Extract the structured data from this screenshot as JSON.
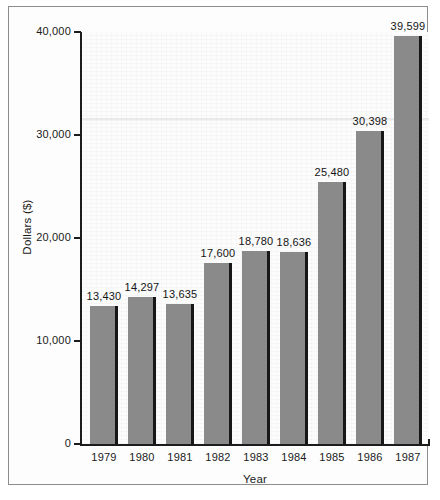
{
  "chart_data": {
    "type": "bar",
    "title": "",
    "xlabel": "Year",
    "ylabel": "Dollars ($)",
    "categories": [
      "1979",
      "1980",
      "1981",
      "1982",
      "1983",
      "1984",
      "1985",
      "1986",
      "1987"
    ],
    "values": [
      13430,
      14297,
      13635,
      17600,
      18780,
      18636,
      25480,
      30398,
      39599
    ],
    "value_labels": [
      "13,430",
      "14,297",
      "13,635",
      "17,600",
      "18,780",
      "18,636",
      "25,480",
      "30,398",
      "39,599"
    ],
    "ylim": [
      0,
      40000
    ],
    "ytick_labels": [
      "0",
      "10,000",
      "20,000",
      "30,000",
      "40,000"
    ],
    "ytick_values": [
      0,
      10000,
      20000,
      30000,
      40000
    ],
    "grid": false,
    "legend": "none",
    "bar_color": "#8a8a8a",
    "bar_shadow_color": "#171717",
    "axis_color": "#1c1c1c",
    "background_color": "#fcfcfc"
  }
}
